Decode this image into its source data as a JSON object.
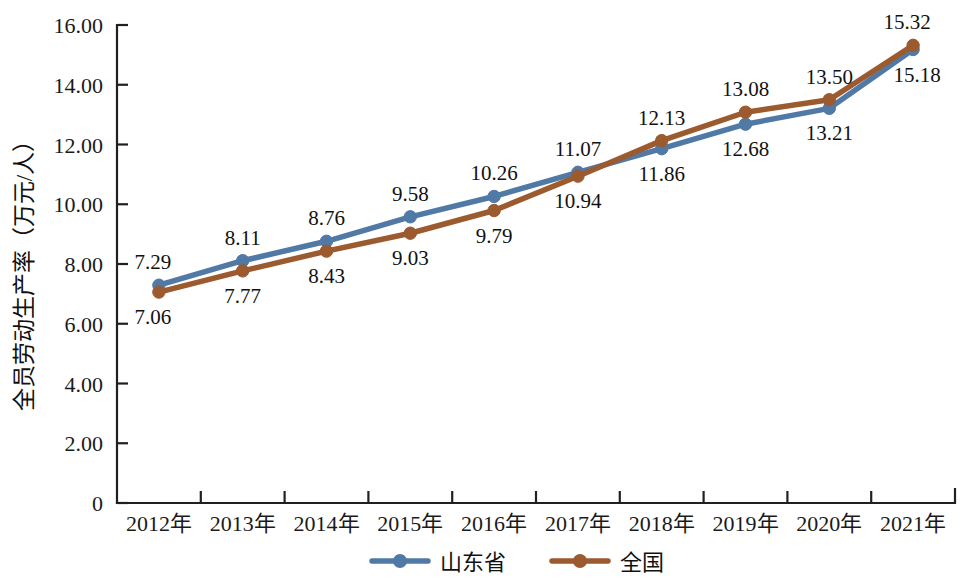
{
  "chart_data": {
    "type": "line",
    "title": "",
    "xlabel": "",
    "ylabel": "全员劳动生产率（万元/人）",
    "categories": [
      "2012年",
      "2013年",
      "2014年",
      "2015年",
      "2016年",
      "2017年",
      "2018年",
      "2019年",
      "2020年",
      "2021年"
    ],
    "ylim": [
      0,
      16
    ],
    "ytick_labels": [
      "0",
      "2.00",
      "4.00",
      "6.00",
      "8.00",
      "10.00",
      "12.00",
      "14.00",
      "16.00"
    ],
    "ytick_values": [
      0,
      2,
      4,
      6,
      8,
      10,
      12,
      14,
      16
    ],
    "grid": false,
    "legend_position": "bottom",
    "series": [
      {
        "name": "山东省",
        "color": "#5179a6",
        "marker": "circle",
        "values": [
          7.29,
          8.11,
          8.76,
          9.58,
          10.26,
          11.07,
          11.86,
          12.68,
          13.21,
          15.18
        ],
        "labels": [
          "7.29",
          "8.11",
          "8.76",
          "9.58",
          "10.26",
          "11.07",
          "11.86",
          "12.68",
          "13.21",
          "15.18"
        ],
        "label_positions": [
          "above",
          "above",
          "above",
          "above",
          "above",
          "above",
          "below",
          "below",
          "below",
          "below"
        ]
      },
      {
        "name": "全国",
        "color": "#9c5a2f",
        "marker": "circle",
        "values": [
          7.06,
          7.77,
          8.43,
          9.03,
          9.79,
          10.94,
          12.13,
          13.08,
          13.5,
          15.32
        ],
        "labels": [
          "7.06",
          "7.77",
          "8.43",
          "9.03",
          "9.79",
          "10.94",
          "12.13",
          "13.08",
          "13.50",
          "15.32"
        ],
        "label_positions": [
          "below",
          "below",
          "below",
          "below",
          "below",
          "below",
          "above",
          "above",
          "above",
          "above"
        ]
      }
    ]
  },
  "legend": {
    "items": [
      {
        "label": "山东省",
        "color": "#5179a6"
      },
      {
        "label": "全国",
        "color": "#9c5a2f"
      }
    ]
  },
  "axis": {
    "y_title": "全员劳动生产率（万元/人）",
    "y_ticks": [
      "16.00",
      "14.00",
      "12.00",
      "10.00",
      "8.00",
      "6.00",
      "4.00",
      "2.00",
      "0"
    ],
    "x_ticks": [
      "2012年",
      "2013年",
      "2014年",
      "2015年",
      "2016年",
      "2017年",
      "2018年",
      "2019年",
      "2020年",
      "2021年"
    ]
  }
}
